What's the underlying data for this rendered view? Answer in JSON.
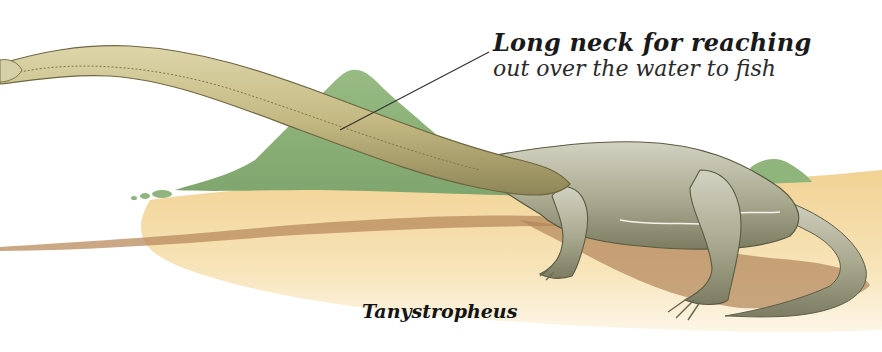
{
  "illustration": {
    "subject": "Tanystropheus",
    "callout": {
      "title": "Long neck for reaching",
      "description": "out over the water to fish"
    },
    "species_label": "Tanystropheus",
    "colors": {
      "background": "#ffffff",
      "ground_sand": "#f3d9a0",
      "ground_shadow": "#b88a5c",
      "bush_green": "#8fb47c",
      "body_grey": "#b8b8a0",
      "neck_tan": "#c9bf8c",
      "leader_line": "#333333"
    }
  }
}
